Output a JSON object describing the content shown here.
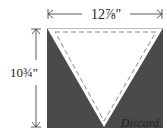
{
  "diagram": {
    "type": "quilt-cutting-diagram",
    "width_label": "12⅞\"",
    "height_label": "10¾\"",
    "discard_label": "Discard.",
    "colors": {
      "fabric_dark": "#4a4a4a",
      "triangle_fill": "#ffffff",
      "seam_line": "#888888",
      "arrow": "#333333"
    }
  }
}
